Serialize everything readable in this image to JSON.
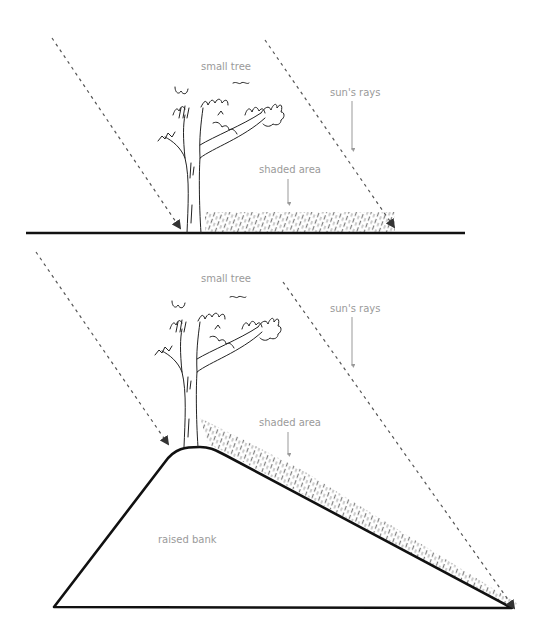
{
  "diagrams": [
    {
      "id": "flat-ground",
      "labels": {
        "tree": "small tree",
        "rays": "sun's rays",
        "shade": "shaded area"
      }
    },
    {
      "id": "raised-bank",
      "labels": {
        "tree": "small tree",
        "rays": "sun's rays",
        "shade": "shaded area",
        "bank": "raised bank"
      }
    }
  ],
  "colors": {
    "line": "#111111",
    "label": "#9a9a9a",
    "shade": "#8a8a8a",
    "background": "#ffffff"
  }
}
